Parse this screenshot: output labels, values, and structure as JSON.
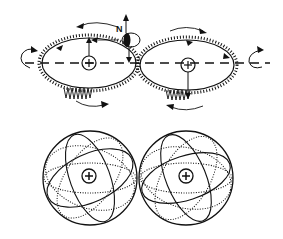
{
  "diagram": {
    "top_panel": {
      "description": "Two toothed elliptical orbit rings meshing like gears along a dashed axis",
      "labels": {
        "north": "N"
      },
      "left_nucleus": {
        "symbol": "+"
      },
      "right_nucleus": {
        "symbol": "+"
      }
    },
    "bottom_panel": {
      "description": "Two spheres with dotted and solid great-circle orbits touching at a point",
      "left_nucleus": {
        "symbol": "+"
      },
      "right_nucleus": {
        "symbol": "+"
      }
    },
    "colors": {
      "ink": "#111111",
      "background": "#ffffff"
    }
  }
}
